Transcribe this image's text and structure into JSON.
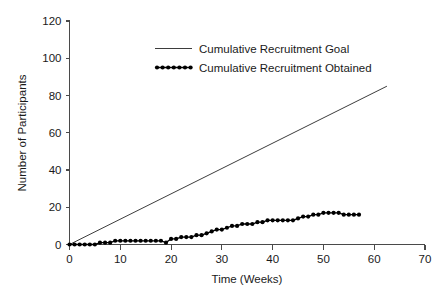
{
  "chart_data": {
    "type": "line",
    "title": "",
    "xlabel": "Time (Weeks)",
    "ylabel": "Number of Participants",
    "xlim": [
      0,
      70
    ],
    "ylim": [
      0,
      120
    ],
    "xticks": [
      0,
      10,
      20,
      30,
      40,
      50,
      60,
      70
    ],
    "yticks": [
      0,
      20,
      40,
      60,
      80,
      100,
      120
    ],
    "xtick_labels": [
      "0",
      "10",
      "20",
      "30",
      "40",
      "50",
      "60",
      "70"
    ],
    "ytick_labels": [
      "0",
      "20",
      "40",
      "60",
      "80",
      "100",
      "120"
    ],
    "grid": false,
    "legend_position": "upper center",
    "series": [
      {
        "name": "Cumulative Recruitment Goal",
        "style": "line",
        "color": "#3d3d3d",
        "x": [
          0,
          62.5
        ],
        "values": [
          0,
          85
        ]
      },
      {
        "name": "Cumulative Recruitment Obtained",
        "style": "line-markers",
        "color": "#000000",
        "x": [
          0,
          1,
          2,
          3,
          4,
          5,
          6,
          7,
          8,
          9,
          10,
          11,
          12,
          13,
          14,
          15,
          16,
          17,
          18,
          19,
          20,
          21,
          22,
          23,
          24,
          25,
          26,
          27,
          28,
          29,
          30,
          31,
          32,
          33,
          34,
          35,
          36,
          37,
          38,
          39,
          40,
          41,
          42,
          43,
          44,
          45,
          46,
          47,
          48,
          49,
          50,
          51,
          52,
          53,
          54,
          55,
          56,
          57
        ],
        "values": [
          0,
          0,
          0,
          0,
          0,
          0,
          1,
          1,
          1,
          2,
          2,
          2,
          2,
          2,
          2,
          2,
          2,
          2,
          2,
          1,
          3,
          3,
          4,
          4,
          4,
          5,
          5,
          6,
          7,
          8,
          8,
          9,
          10,
          10,
          11,
          11,
          11,
          12,
          12,
          13,
          13,
          13,
          13,
          13,
          13,
          14,
          15,
          15,
          16,
          16,
          17,
          17,
          17,
          17,
          16,
          16,
          16,
          16
        ]
      }
    ]
  },
  "legend": {
    "items": [
      {
        "label": "Cumulative Recruitment Goal",
        "style": "line"
      },
      {
        "label": "Cumulative Recruitment Obtained",
        "style": "dotted-markers"
      }
    ]
  }
}
